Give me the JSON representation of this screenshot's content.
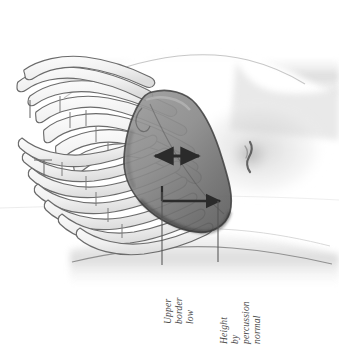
{
  "figure": {
    "kind": "medical-line-drawing",
    "alt": "Side view of a torso showing the rib cage and a shaded liver, with measurement arrows and annotations"
  },
  "annotations": [
    {
      "id": "upper-border-low",
      "name": "upper-border-low-label",
      "lines": [
        "Upper",
        "border",
        "low"
      ],
      "text": "Upper border low",
      "rotation_deg": -90,
      "leader": {
        "x": 162,
        "y_top": 192,
        "y_bottom": 265
      }
    },
    {
      "id": "height-by-percussion-normal",
      "name": "height-by-percussion-normal-label",
      "lines": [
        "Height",
        "by",
        "percussion",
        "normal"
      ],
      "text": "Height by percussion normal",
      "rotation_deg": -90,
      "leader": {
        "x": 218,
        "y_top": 201,
        "y_bottom": 262
      }
    }
  ],
  "measurements": [
    {
      "id": "upper-border-span",
      "name": "double-headed-arrow",
      "style": "double-headed-horizontal-arrow",
      "x_start": 152,
      "x_end": 202,
      "y": 156
    },
    {
      "id": "liver-height-span",
      "name": "height-bracket-arrow",
      "style": "bracket-with-right-arrowhead",
      "x_start": 162,
      "x_end": 224,
      "y": 201,
      "riser_y": 186
    }
  ],
  "anatomy": {
    "ribs_upper_count": 8,
    "ribs_lower_count": 8,
    "liver_label": "liver",
    "umbilicus_label": "umbilicus",
    "torso_label": "torso-contour"
  },
  "colors": {
    "background": "#ffffff",
    "ink": "#3a3a3a",
    "annotation_text": "#4a4a4a",
    "leader_line": "#555555",
    "arrow": "#2b2b2b",
    "liver_fill": "#8d8d8d",
    "liver_fill_dark": "#6f6f6f",
    "rib_fill": "#f3f3f3",
    "rib_stroke": "#6b6b6b",
    "skin_shade": "#d8d8d8",
    "skin_shade_soft": "#ececec"
  }
}
